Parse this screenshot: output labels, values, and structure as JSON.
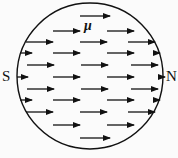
{
  "diagram": {
    "circle": {
      "cx": 90,
      "cy": 76,
      "r": 73,
      "stroke": "#111111"
    },
    "labels": {
      "south": "S",
      "north": "N",
      "moment": "μ"
    },
    "arrow_color": "#111111",
    "arrows": [
      {
        "x1": 80,
        "y1": 16,
        "x2": 110
      },
      {
        "x1": 53,
        "y1": 31,
        "x2": 80
      },
      {
        "x1": 107,
        "y1": 31,
        "x2": 134
      },
      {
        "x1": 26,
        "y1": 42,
        "x2": 53
      },
      {
        "x1": 80,
        "y1": 42,
        "x2": 107
      },
      {
        "x1": 128,
        "y1": 42,
        "x2": 155
      },
      {
        "x1": 20,
        "y1": 53,
        "x2": 32
      },
      {
        "x1": 53,
        "y1": 53,
        "x2": 80
      },
      {
        "x1": 107,
        "y1": 53,
        "x2": 134
      },
      {
        "x1": 155,
        "y1": 53,
        "x2": 160
      },
      {
        "x1": 27,
        "y1": 65,
        "x2": 54
      },
      {
        "x1": 81,
        "y1": 65,
        "x2": 108
      },
      {
        "x1": 131,
        "y1": 65,
        "x2": 158
      },
      {
        "x1": 17,
        "y1": 77,
        "x2": 28
      },
      {
        "x1": 53,
        "y1": 77,
        "x2": 80
      },
      {
        "x1": 107,
        "y1": 77,
        "x2": 134
      },
      {
        "x1": 158,
        "y1": 77,
        "x2": 165
      },
      {
        "x1": 27,
        "y1": 89,
        "x2": 54
      },
      {
        "x1": 81,
        "y1": 89,
        "x2": 108
      },
      {
        "x1": 131,
        "y1": 89,
        "x2": 158
      },
      {
        "x1": 20,
        "y1": 100,
        "x2": 32
      },
      {
        "x1": 53,
        "y1": 100,
        "x2": 80
      },
      {
        "x1": 107,
        "y1": 100,
        "x2": 134
      },
      {
        "x1": 155,
        "y1": 100,
        "x2": 160
      },
      {
        "x1": 26,
        "y1": 112,
        "x2": 53
      },
      {
        "x1": 80,
        "y1": 112,
        "x2": 107
      },
      {
        "x1": 128,
        "y1": 112,
        "x2": 155
      },
      {
        "x1": 53,
        "y1": 125,
        "x2": 80
      },
      {
        "x1": 107,
        "y1": 125,
        "x2": 134
      },
      {
        "x1": 80,
        "y1": 138,
        "x2": 110
      }
    ]
  }
}
